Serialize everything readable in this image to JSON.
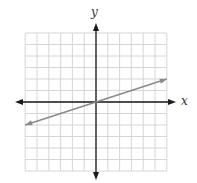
{
  "chart_data": {
    "type": "line",
    "title": "",
    "xlabel": "x",
    "ylabel": "y",
    "xlim": [
      -6,
      6
    ],
    "ylim": [
      -6,
      6
    ],
    "grid": true,
    "grid_step": 1,
    "tick_labels": false,
    "legend": null,
    "series": [
      {
        "name": "line",
        "equation": "y = x/3",
        "slope": 0.333,
        "intercept": 0,
        "x": [
          -6,
          6
        ],
        "y": [
          -2,
          2
        ],
        "arrows": "both",
        "color": "#8a8a8a"
      }
    ]
  },
  "labels": {
    "x_axis": "x",
    "y_axis": "y"
  },
  "colors": {
    "grid": "#d6d6d6",
    "axes": "#1a1a1a",
    "line": "#8a8a8a"
  }
}
